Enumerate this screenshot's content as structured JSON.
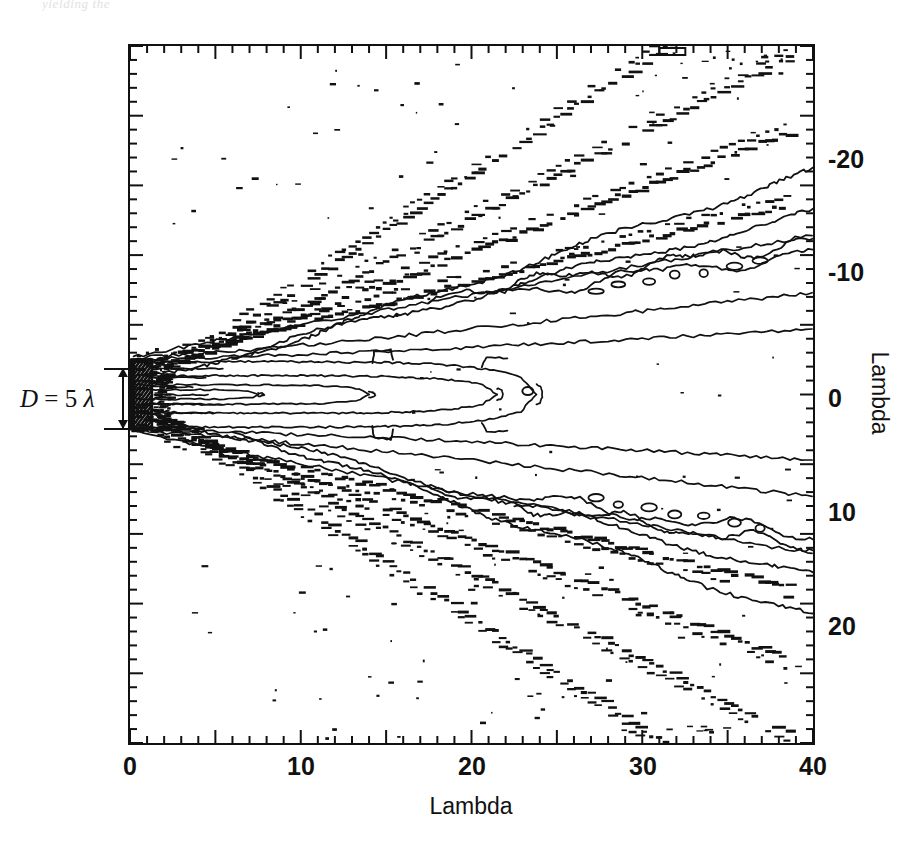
{
  "page_bleed_text": "yielding the",
  "axes": {
    "x_title": "Lambda",
    "y_title": "Lambda",
    "x_ticks": [
      "0",
      "10",
      "20",
      "30",
      "40"
    ],
    "y_ticks": [
      "-20",
      "-10",
      "0",
      "10",
      "20"
    ]
  },
  "annotation": {
    "aperture_label_d": "D",
    "aperture_label_eq": "= 5",
    "aperture_label_lambda": "λ",
    "icon_dimension_arrow": "double-headed-vertical-arrow"
  },
  "colors": {
    "ink": "#111111",
    "background": "#ffffff",
    "bleed": "#c9c9c9"
  },
  "chart_data": {
    "type": "line",
    "title": "",
    "subtitle": "",
    "xlabel": "Lambda",
    "ylabel": "Lambda",
    "xlim": [
      0,
      40
    ],
    "ylim": [
      -25,
      25
    ],
    "y_axis_inverted": true,
    "grid": false,
    "legend": null,
    "x_major_ticks": [
      0,
      5,
      10,
      15,
      20,
      25,
      30,
      35,
      40
    ],
    "x_minor_tick_step": 1,
    "y_major_ticks": [
      -25,
      -20,
      -15,
      -10,
      -5,
      0,
      5,
      10,
      15,
      20,
      25
    ],
    "y_minor_tick_step": 1,
    "x_labeled_ticks": [
      0,
      10,
      20,
      30,
      40
    ],
    "y_labeled_ticks": [
      -20,
      -10,
      0,
      10,
      20
    ],
    "tick_direction": "in",
    "aperture": {
      "x": 0,
      "y_from": -2.5,
      "y_to": 2.5,
      "diameter": 5,
      "units": "lambda",
      "hatched": true
    },
    "symmetry_axis_y": 0,
    "contour_levels_relative": [
      -3,
      -6,
      -10,
      -14,
      -20,
      -26,
      -32
    ],
    "main_lobe_closure_x": 24,
    "sidelobe_rays": [
      {
        "name": "inner-upper",
        "slope": -0.3,
        "y_intercept": -2.2
      },
      {
        "name": "inner-lower",
        "slope": 0.3,
        "y_intercept": 2.2
      },
      {
        "name": "mid-upper",
        "slope": -0.46,
        "y_intercept": -1.2
      },
      {
        "name": "mid-lower",
        "slope": 0.46,
        "y_intercept": 1.2
      },
      {
        "name": "outer-upper",
        "slope": -0.62,
        "y_intercept": -0.4
      },
      {
        "name": "outer-lower",
        "slope": 0.62,
        "y_intercept": 0.4
      },
      {
        "name": "far-upper",
        "slope": -0.8,
        "y_intercept": 0.0
      },
      {
        "name": "far-lower",
        "slope": 0.8,
        "y_intercept": 0.0
      }
    ],
    "series": [
      {
        "name": "contour -3 dB (upper)",
        "style": "solid",
        "x": [
          0,
          2,
          5,
          9,
          14,
          19,
          24,
          29,
          34,
          40
        ],
        "values": [
          -2.5,
          -2.2,
          -2.0,
          -1.9,
          -1.8,
          -1.8,
          -1.7,
          -1.8,
          -1.9,
          -2.0
        ]
      },
      {
        "name": "contour -3 dB (lower)",
        "style": "solid",
        "x": [
          0,
          2,
          5,
          9,
          14,
          19,
          24,
          29,
          34,
          40
        ],
        "values": [
          2.5,
          2.2,
          2.0,
          1.9,
          1.8,
          1.8,
          1.7,
          1.8,
          1.9,
          2.0
        ]
      },
      {
        "name": "contour -6 dB (upper)",
        "style": "solid",
        "x": [
          0,
          3,
          7,
          12,
          17,
          22,
          27,
          32,
          36,
          40
        ],
        "values": [
          -2.5,
          -2.9,
          -3.1,
          -3.2,
          -3.3,
          -3.4,
          -3.6,
          -3.9,
          -4.2,
          -4.6
        ]
      },
      {
        "name": "contour -6 dB (lower)",
        "style": "solid",
        "x": [
          0,
          3,
          7,
          12,
          17,
          22,
          27,
          32,
          36,
          40
        ],
        "values": [
          2.5,
          2.9,
          3.1,
          3.2,
          3.3,
          3.4,
          3.6,
          3.9,
          4.2,
          4.6
        ]
      },
      {
        "name": "contour -10 dB (upper)",
        "style": "solid",
        "x": [
          0,
          4,
          9,
          14,
          20,
          26,
          32,
          36,
          40
        ],
        "values": [
          -2.6,
          -3.6,
          -4.3,
          -4.8,
          -5.2,
          -5.6,
          -6.2,
          -6.6,
          -7.2
        ]
      },
      {
        "name": "contour -10 dB (lower)",
        "style": "solid",
        "x": [
          0,
          4,
          9,
          14,
          20,
          26,
          32,
          36,
          40
        ],
        "values": [
          2.6,
          3.6,
          4.3,
          4.8,
          5.2,
          5.6,
          6.2,
          6.6,
          7.2
        ]
      },
      {
        "name": "sidelobe ridge inner (upper)",
        "style": "dashed-ridge",
        "x": [
          2,
          8,
          14,
          20,
          26,
          32,
          40
        ],
        "values": [
          -3.0,
          -5.0,
          -7.0,
          -8.9,
          -10.8,
          -12.6,
          -15.0
        ]
      },
      {
        "name": "sidelobe ridge inner (lower)",
        "style": "dashed-ridge",
        "x": [
          2,
          8,
          14,
          20,
          26,
          32,
          40
        ],
        "values": [
          3.0,
          5.0,
          7.0,
          8.9,
          10.8,
          12.6,
          15.0
        ]
      },
      {
        "name": "sidelobe ridge outer (upper)",
        "style": "dashed-ridge",
        "x": [
          1,
          7,
          13,
          19,
          25,
          31,
          38
        ],
        "values": [
          -3.0,
          -6.5,
          -10.0,
          -13.6,
          -17.2,
          -20.8,
          -25.0
        ]
      },
      {
        "name": "sidelobe ridge outer (lower)",
        "style": "dashed-ridge",
        "x": [
          1,
          7,
          13,
          19,
          25,
          31,
          38
        ],
        "values": [
          3.0,
          6.5,
          10.0,
          13.6,
          17.2,
          20.8,
          25.0
        ]
      }
    ]
  }
}
